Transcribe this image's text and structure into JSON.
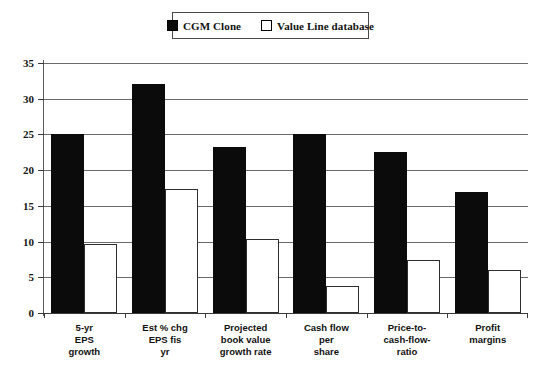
{
  "legend": {
    "position": "top-center",
    "entries": [
      {
        "label": "CGM Clone",
        "swatch": "filled-black",
        "color": "#0b0b0b"
      },
      {
        "label": "Value Line database",
        "swatch": "hollow-white",
        "color": "#ffffff"
      }
    ]
  },
  "chart_data": {
    "type": "bar",
    "title": "",
    "subtitle": "",
    "xlabel": "",
    "ylabel": "",
    "ylim": [
      0,
      35
    ],
    "yticks": [
      0,
      5,
      10,
      15,
      20,
      25,
      30,
      35
    ],
    "ytick_labels": [
      "0",
      "5",
      "10",
      "15",
      "20",
      "25",
      "30",
      "35"
    ],
    "grid": true,
    "legend_position": "top-center",
    "categories": [
      "5-yr EPS growth",
      "Est % chg EPS fis yr",
      "Projected book value growth rate",
      "Cash flow per share",
      "Price-to-cash-flow-ratio",
      "Profit margins"
    ],
    "category_lines": [
      [
        "5-yr",
        "EPS",
        "growth"
      ],
      [
        "Est % chg",
        "EPS fis",
        "yr"
      ],
      [
        "Projected",
        "book value",
        "growth rate"
      ],
      [
        "Cash flow",
        "per",
        "share"
      ],
      [
        "Price-to-",
        "cash-flow-",
        "ratio"
      ],
      [
        "Profit",
        "margins"
      ]
    ],
    "series": [
      {
        "name": "CGM Clone",
        "color": "#0b0b0b",
        "values": [
          25.0,
          32.0,
          23.2,
          25.0,
          22.6,
          17.0
        ]
      },
      {
        "name": "Value Line database",
        "color": "#ffffff",
        "values": [
          9.7,
          17.4,
          10.4,
          3.8,
          7.4,
          6.0
        ]
      }
    ]
  }
}
